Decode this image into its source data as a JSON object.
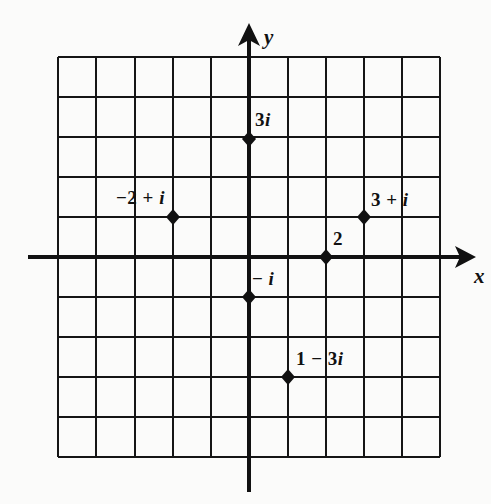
{
  "figure": {
    "kind": "complex-plane-scatter",
    "background_color": "#fbfbfa",
    "ink_color": "#111111"
  },
  "axes": {
    "x_label": "x",
    "y_label": "y",
    "x_arrow": "right-arrow-icon",
    "y_arrow": "up-arrow-icon"
  },
  "chart_data": {
    "type": "scatter",
    "title": "",
    "xlabel": "x",
    "ylabel": "y",
    "xlim": [
      -5,
      5
    ],
    "ylim": [
      -5,
      5
    ],
    "grid": true,
    "grid_step": 1,
    "legend": "none",
    "points": [
      {
        "label": "3i",
        "x": 0,
        "y": 3,
        "label_pos": "above-right"
      },
      {
        "label": "-2 + i",
        "x": -2,
        "y": 1,
        "label_pos": "above-center"
      },
      {
        "label": "3 + i",
        "x": 3,
        "y": 1,
        "label_pos": "above-right"
      },
      {
        "label": "2",
        "x": 2,
        "y": 0,
        "label_pos": "above-right"
      },
      {
        "label": "- i",
        "x": 0,
        "y": -1,
        "label_pos": "above-right"
      },
      {
        "label": "1 - 3i",
        "x": 1,
        "y": -3,
        "label_pos": "above-right"
      }
    ]
  },
  "point_labels": {
    "three_i": "3i",
    "minus_two_plus_i": "−2  +  i",
    "three_plus_i": "3  +  i",
    "two": "2",
    "minus_i": "− i",
    "one_minus_three_i": "1  −  3i"
  }
}
